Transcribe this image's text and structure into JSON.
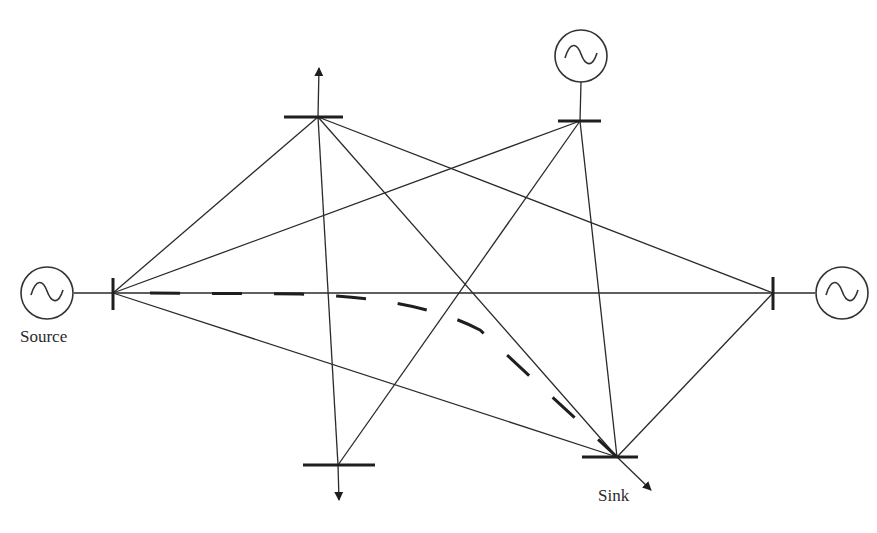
{
  "diagram": {
    "type": "power-network",
    "labels": {
      "source": "Source",
      "sink": "Sink"
    },
    "nodes": [
      {
        "id": "A",
        "role": "source-bus",
        "x": 113,
        "y": 293,
        "orientation": "vertical",
        "generator": true
      },
      {
        "id": "B",
        "role": "load-bus",
        "x": 318,
        "y": 117,
        "orientation": "horizontal",
        "load_arrow": "up"
      },
      {
        "id": "C",
        "role": "generator-bus",
        "x": 580,
        "y": 121,
        "orientation": "horizontal",
        "generator": true
      },
      {
        "id": "D",
        "role": "generator-bus",
        "x": 773,
        "y": 293,
        "orientation": "vertical",
        "generator": true
      },
      {
        "id": "E",
        "role": "load-bus",
        "x": 338,
        "y": 465,
        "orientation": "horizontal",
        "load_arrow": "down"
      },
      {
        "id": "F",
        "role": "sink-bus",
        "x": 617,
        "y": 457,
        "orientation": "horizontal",
        "load_arrow": "down-right"
      }
    ],
    "edges": [
      [
        "A",
        "B"
      ],
      [
        "A",
        "C"
      ],
      [
        "A",
        "D"
      ],
      [
        "A",
        "F"
      ],
      [
        "B",
        "E"
      ],
      [
        "B",
        "F"
      ],
      [
        "B",
        "D"
      ],
      [
        "C",
        "E"
      ],
      [
        "C",
        "F"
      ],
      [
        "D",
        "F"
      ]
    ],
    "highlighted_path": {
      "from": "A",
      "to": "F",
      "style": "dashed"
    },
    "colors": {
      "line": "#2a2a2a",
      "background": "#ffffff"
    }
  }
}
